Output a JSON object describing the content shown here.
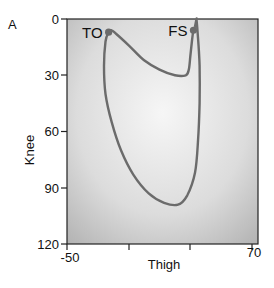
{
  "panel_label": "A",
  "chart_data": {
    "type": "line",
    "title": "",
    "xlabel": "Thigh",
    "ylabel": "Knee",
    "xlim": [
      -50,
      70
    ],
    "ylim": [
      0,
      120
    ],
    "y_inverted": true,
    "x_ticks": [
      -50,
      -10,
      30,
      70
    ],
    "x_tick_labels": [
      "-50",
      "",
      "",
      "70"
    ],
    "y_ticks": [
      0,
      30,
      60,
      90,
      120
    ],
    "y_tick_labels": [
      "0",
      "30",
      "60",
      "90",
      "120"
    ],
    "grid": false,
    "legend": null,
    "series": [
      {
        "name": "Knee vs Thigh angle cycle",
        "points": [
          [
            34,
            -8
          ],
          [
            34,
            0
          ],
          [
            33,
            4
          ],
          [
            32,
            6
          ],
          [
            31,
            12
          ],
          [
            30,
            20
          ],
          [
            29,
            27
          ],
          [
            27,
            30
          ],
          [
            20,
            30
          ],
          [
            10,
            27
          ],
          [
            0,
            22
          ],
          [
            -10,
            14
          ],
          [
            -18,
            8
          ],
          [
            -21,
            6
          ],
          [
            -23,
            7
          ],
          [
            -25,
            12
          ],
          [
            -26,
            25
          ],
          [
            -25,
            40
          ],
          [
            -21,
            55
          ],
          [
            -15,
            70
          ],
          [
            -7,
            83
          ],
          [
            3,
            93
          ],
          [
            13,
            98
          ],
          [
            22,
            99
          ],
          [
            28,
            94
          ],
          [
            33,
            82
          ],
          [
            35,
            65
          ],
          [
            36,
            45
          ],
          [
            36,
            25
          ],
          [
            35,
            10
          ],
          [
            34,
            0
          ]
        ]
      }
    ],
    "annotations": [
      {
        "label": "TO",
        "x": -23,
        "y": 7
      },
      {
        "label": "FS",
        "x": 32,
        "y": 6
      }
    ]
  },
  "colors": {
    "curve": "#6b6b6b",
    "marker": "#6b6b6b",
    "plot_bg_center": "#f4f4f4",
    "plot_bg_edge": "#b9b9b9",
    "axis": "#222222"
  }
}
